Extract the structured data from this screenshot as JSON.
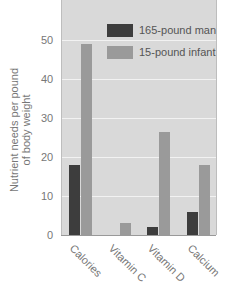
{
  "chart_data": {
    "type": "bar",
    "title": "",
    "xlabel": "",
    "ylabel": "Nutrient needs per pound of body weight",
    "ylabel_lines": [
      "Nutrient needs per pound",
      "of body weight"
    ],
    "categories": [
      "Calories",
      "Vitamin C",
      "Vitamin D",
      "Calcium"
    ],
    "series": [
      {
        "name": "165-pound man",
        "color": "#3d3d3d",
        "values": [
          18,
          0,
          2,
          6
        ]
      },
      {
        "name": "15-pound infant",
        "color": "#9a9a9a",
        "values": [
          49,
          3,
          26.5,
          18
        ]
      }
    ],
    "yticks": [
      "0",
      "10",
      "20",
      "30",
      "40",
      "50"
    ],
    "ylim": [
      0,
      60
    ],
    "grid": true,
    "legend_position": "top-right"
  }
}
